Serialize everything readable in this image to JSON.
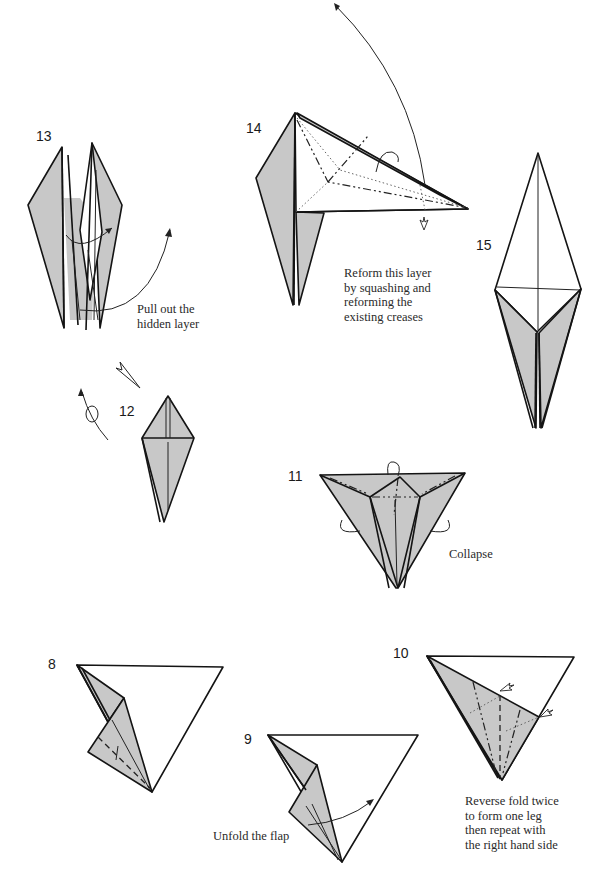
{
  "page": {
    "background": "#ffffff",
    "paper_shade": "#c8c8c8",
    "line_color": "#141414"
  },
  "steps": [
    {
      "number": "8",
      "caption": ""
    },
    {
      "number": "9",
      "caption": "Unfold the flap"
    },
    {
      "number": "10",
      "caption": "Reverse fold twice\nto form one leg\nthen repeat with\nthe right hand side"
    },
    {
      "number": "11",
      "caption": "Collapse"
    },
    {
      "number": "12",
      "caption": ""
    },
    {
      "number": "13",
      "caption": "Pull out the\nhidden layer"
    },
    {
      "number": "14",
      "caption": "Reform this layer\nby squashing and\nreforming the\nexisting creases"
    },
    {
      "number": "15",
      "caption": ""
    }
  ],
  "icons": {
    "turn_over": "turn-over-loop-arrow",
    "push_arrow": "hollow-push-arrow",
    "fold_arrow": "curved-arrow"
  }
}
